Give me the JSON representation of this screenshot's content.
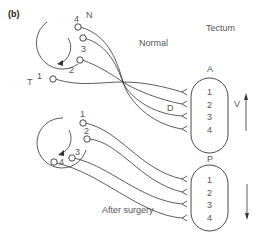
{
  "panel_label": "(b)",
  "titles": {
    "tectum": "Tectum",
    "normal": "Normal",
    "after": "After surgery"
  },
  "retina_top": {
    "nasal_label": "N",
    "temporal_label": "T",
    "cells": [
      "1",
      "2",
      "3",
      "4"
    ]
  },
  "retina_bottom": {
    "cells": [
      "1",
      "2",
      "3",
      "4"
    ]
  },
  "tectum_top": {
    "anterior_label": "A",
    "posterior_label": "P",
    "dorsal_label": "D",
    "ventral_label": "V",
    "positions": [
      "1",
      "2",
      "3",
      "4"
    ]
  },
  "tectum_bottom": {
    "positions": [
      "1",
      "2",
      "3",
      "4"
    ]
  },
  "colors": {
    "line": "#333333",
    "text": "#555555"
  }
}
